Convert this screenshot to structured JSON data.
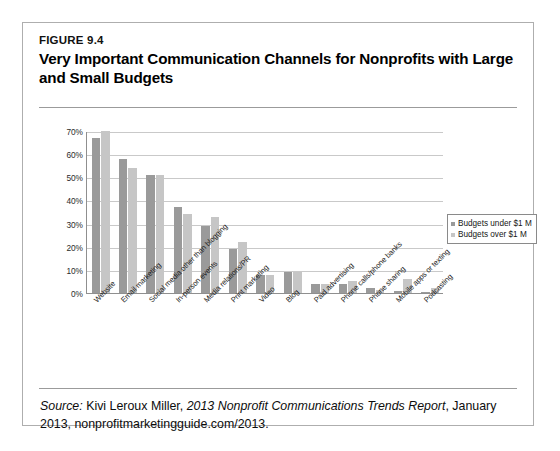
{
  "figure": {
    "number": "FIGURE 9.4",
    "title": "Very Important Communication Channels for Nonprofits with Large and Small Budgets",
    "source_prefix": "Source:",
    "source_author": " Kivi Leroux Miller, ",
    "source_report": "2013 Nonprofit Communications Trends Report",
    "source_tail": ", January 2013, nonprofitmarketingguide.com/2013."
  },
  "chart_data": {
    "type": "bar",
    "title": "Very Important Communication Channels for Nonprofits with Large and Small Budgets",
    "xlabel": "",
    "ylabel": "",
    "ylim": [
      0,
      70
    ],
    "ytick_labels": [
      "70%",
      "60%",
      "50%",
      "40%",
      "30%",
      "20%",
      "10%",
      "0%"
    ],
    "ytick_values": [
      70,
      60,
      50,
      40,
      30,
      20,
      10,
      0
    ],
    "grid": true,
    "legend_position": "right",
    "categories": [
      "Website",
      "Email marketing",
      "Social media other than blogging",
      "In-person events",
      "Media relations/PR",
      "Print marketing",
      "Video",
      "Blog",
      "Paid advertising",
      "Phone calls/phone banks",
      "Phone sharing",
      "Mobile apps or texting",
      "Podcasting"
    ],
    "series": [
      {
        "name": "Budgets under $1 M",
        "color": "#9a9a9a",
        "values": [
          67,
          58,
          51,
          37,
          29,
          19,
          8,
          9,
          4,
          4,
          2,
          1,
          0.5
        ]
      },
      {
        "name": "Budgets over $1 M",
        "color": "#c6c6c6",
        "values": [
          70,
          54,
          51,
          34,
          33,
          22,
          8,
          9,
          4,
          5,
          1.5,
          6,
          2
        ]
      }
    ]
  }
}
